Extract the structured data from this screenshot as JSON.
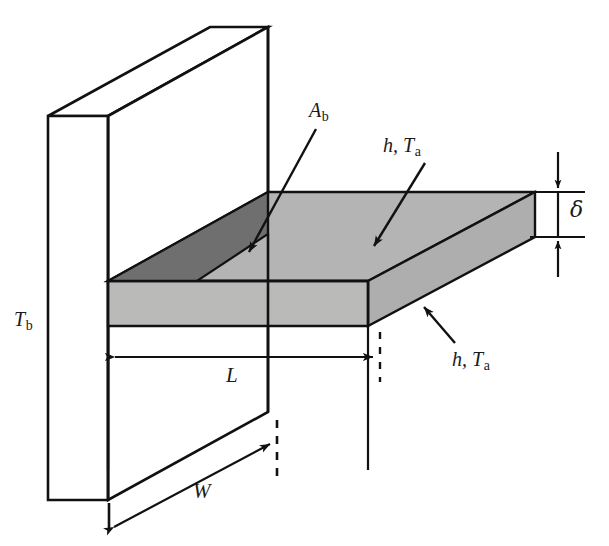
{
  "figure": {
    "kind": "engineering-diagram",
    "colors": {
      "outline": "#111111",
      "fin_top_face": "#b3b3b3",
      "fin_front_face": "#b8b8b8",
      "fin_right_face": "#b0b0b0",
      "base_area_Ab": "#6e6e6e",
      "wall_face": "#ffffff",
      "background": "#ffffff"
    },
    "labels": {
      "base_area": {
        "symbol": "A",
        "subscript": "b",
        "text": "A_b"
      },
      "convection_top": {
        "symbol": "h, T",
        "subscript": "a",
        "text": "h, T_a"
      },
      "convection_side": {
        "symbol": "h, T",
        "subscript": "a",
        "text": "h, T_a"
      },
      "base_temperature": {
        "symbol": "T",
        "subscript": "b",
        "text": "T_b"
      },
      "thickness": {
        "symbol": "δ",
        "text": "delta"
      },
      "length": {
        "symbol": "L",
        "text": "L"
      },
      "width": {
        "symbol": "W",
        "text": "W"
      }
    },
    "dimensions": [
      {
        "name": "L",
        "label": "L",
        "orientation": "horizontal",
        "arrows": "double"
      },
      {
        "name": "W",
        "label": "W",
        "orientation": "oblique",
        "arrows": "double"
      },
      {
        "name": "delta",
        "label": "δ",
        "orientation": "vertical",
        "arrows": "double-inward"
      }
    ],
    "leaders": [
      {
        "name": "Ab-leader",
        "from_label": "A_b",
        "points_to": "fin base cross-section"
      },
      {
        "name": "h-Ta-top-leader",
        "from_label": "h, T_a",
        "points_to": "fin top surface"
      },
      {
        "name": "h-Ta-side-leader",
        "from_label": "h, T_a",
        "points_to": "fin side surface"
      }
    ]
  }
}
